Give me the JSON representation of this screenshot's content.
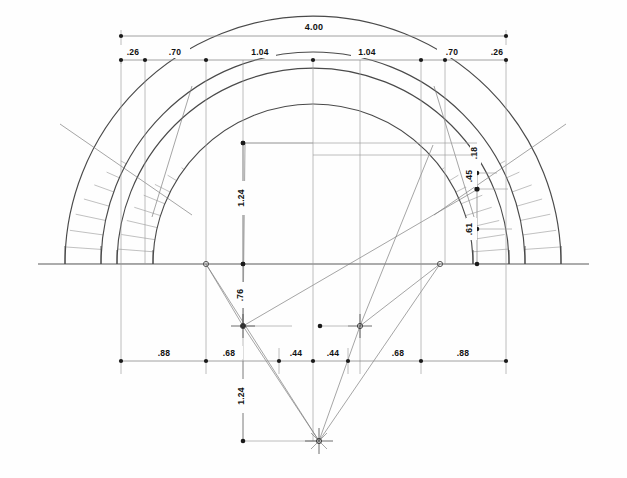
{
  "drawing": {
    "title": "Two-ring voussoir arch — dimensioned construction drawing",
    "units": "meters (decimal)",
    "background_color": "#fefefe",
    "line_color": "#6f6f6f",
    "dim_line_color": "#8a8a8a",
    "text_color": "#111111",
    "marker_color": "#1a1a1a"
  },
  "dimensions": {
    "overall_span": "4.00",
    "top_chain": [
      ".26",
      ".70",
      "1.04",
      "1.04",
      ".70",
      ".26"
    ],
    "bottom_chain": [
      ".88",
      ".68",
      ".44",
      ".44",
      ".68",
      ".88"
    ],
    "vertical_center_upper": "1.24",
    "vertical_center_lower": "1.24",
    "vertical_left_offset": ".76",
    "right_stack": [
      ".18",
      ".45",
      ".61"
    ]
  },
  "labels": {
    "span_4_00": "4.00",
    "t_26_left": ".26",
    "t_70_left": ".70",
    "t_104_left": "1.04",
    "t_104_right": "1.04",
    "t_70_right": ".70",
    "t_26_right": ".26",
    "b_88_left": ".88",
    "b_68_left": ".68",
    "b_44_left": ".44",
    "b_44_right": ".44",
    "b_68_right": ".68",
    "b_88_right": ".88",
    "v_124_upper": "1.24",
    "v_124_lower": "1.24",
    "v_76": ".76",
    "r_18": ".18",
    "r_45": ".45",
    "r_61": ".61"
  },
  "geometry": {
    "springing_line_y": 264,
    "axis_x": 313,
    "extrados_outer_radius": 248,
    "extrados_inner_radius": 212,
    "intrados_outer_radius": 196,
    "intrados_inner_radius": 160,
    "voussoir_count_outer": 46,
    "voussoir_count_inner": 42,
    "center_left_x": 243,
    "center_right_x": 360,
    "center_y": 326,
    "apex_point_x": 319,
    "apex_point_y": 441
  }
}
